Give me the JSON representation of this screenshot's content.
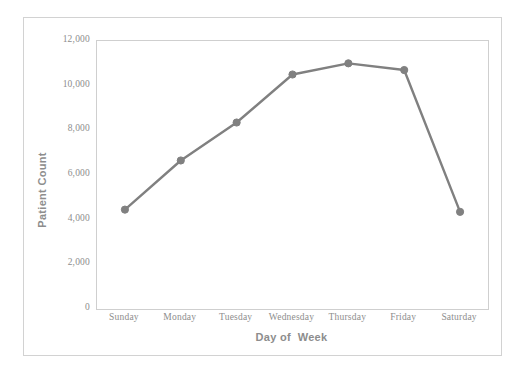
{
  "chart_data": {
    "type": "line",
    "title": "",
    "xlabel": "Day of  Week",
    "ylabel": "Patient Count",
    "categories": [
      "Sunday",
      "Monday",
      "Tuesday",
      "Wednesday",
      "Thursday",
      "Friday",
      "Saturday"
    ],
    "values": [
      4450,
      6650,
      8350,
      10500,
      11000,
      10700,
      4350
    ],
    "series": [
      {
        "name": "Patient Count",
        "values": [
          4450,
          6650,
          8350,
          10500,
          11000,
          10700,
          4350
        ]
      }
    ],
    "ylim": [
      0,
      12000
    ],
    "ytick_values": [
      0,
      2000,
      4000,
      6000,
      8000,
      10000,
      12000
    ],
    "ytick_labels": [
      "0",
      "2,000",
      "4,000",
      "6,000",
      "8,000",
      "10,000",
      "12,000"
    ],
    "grid": false,
    "legend": false,
    "legend_position": "none",
    "marker": "circle",
    "line_color": "#808080",
    "marker_color": "#808080",
    "axis_color": "#cfcfcf",
    "text_color": "#8d8d8d",
    "background_color": "#ffffff"
  }
}
